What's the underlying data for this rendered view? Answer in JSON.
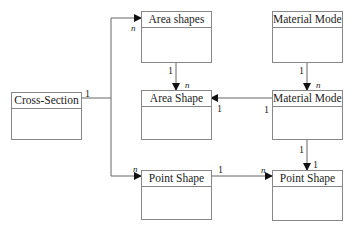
{
  "diagram": {
    "type": "uml-class-diagram",
    "classes": [
      {
        "id": "cross_section",
        "name": "Cross-Section"
      },
      {
        "id": "area_shapes",
        "name": "Area shapes"
      },
      {
        "id": "area_shape",
        "name": "Area Shape"
      },
      {
        "id": "material_models",
        "name": "Material Models"
      },
      {
        "id": "material_model",
        "name": "Material Model"
      },
      {
        "id": "point_shape_left",
        "name": "Point Shape"
      },
      {
        "id": "point_shape_right",
        "name": "Point Shape"
      }
    ],
    "associations": [
      {
        "from": "Cross-Section",
        "to": "Area shapes",
        "from_mult": "1",
        "to_mult": "n"
      },
      {
        "from": "Cross-Section",
        "to": "Point Shape (left)",
        "from_mult": "1",
        "to_mult": "n"
      },
      {
        "from": "Area shapes",
        "to": "Area Shape",
        "from_mult": "1",
        "to_mult": "n"
      },
      {
        "from": "Material Models",
        "to": "Material Model",
        "from_mult": "1",
        "to_mult": "n"
      },
      {
        "from": "Material Model",
        "to": "Area Shape",
        "from_mult": "1",
        "to_mult": "1"
      },
      {
        "from": "Material Model",
        "to": "Point Shape (right)",
        "from_mult": "1",
        "to_mult": "1"
      },
      {
        "from": "Point Shape (left)",
        "to": "Point Shape (right)",
        "from_mult": "1",
        "to_mult": "n"
      }
    ]
  },
  "labels": {
    "cs_one": "1",
    "area_shapes_n": "n",
    "point_left_n": "n",
    "area_shapes_one": "1",
    "area_shape_n": "n",
    "area_shape_one": "1",
    "mm_models_one": "1",
    "mm_model_n": "n",
    "mm_model_left_one": "1",
    "mm_model_bottom_one": "1",
    "point_right_one": "1",
    "point_left_one": "1",
    "point_right_n": "n"
  },
  "colors": {
    "line": "#666666",
    "border": "#888888",
    "arrow": "#111111"
  }
}
